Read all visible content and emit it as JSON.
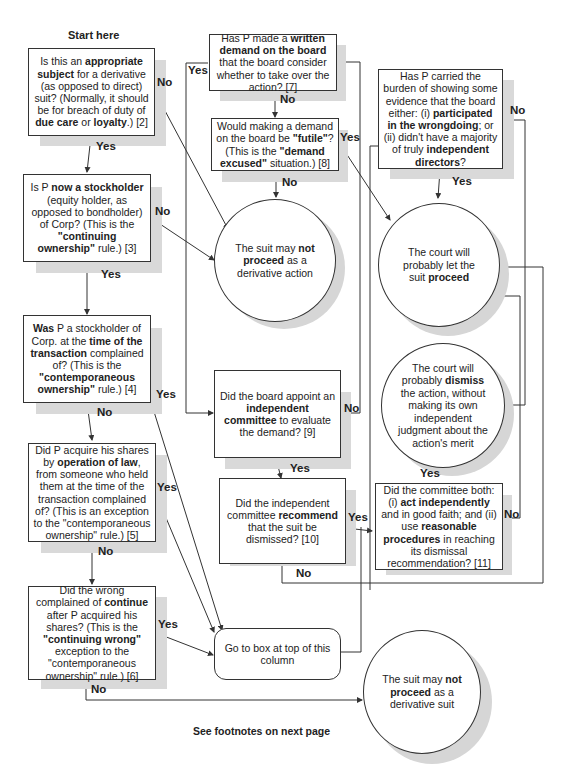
{
  "header": {
    "start_label": "Start here"
  },
  "footer": {
    "note": "See footnotes on next page"
  },
  "nodes": {
    "q2": {
      "parts": [
        "Is this an ",
        "appropriate subject",
        " for a derivative (as opposed to direct) suit? (Normally, it should be for breach of duty of ",
        "due care",
        " or ",
        "loyalty",
        ".) [2]"
      ]
    },
    "q3": {
      "parts": [
        "Is P ",
        "now a stockholder",
        " (equity holder, as opposed to bondholder) of Corp? (This is the ",
        "\"continuing ownership\"",
        " rule.) [3]"
      ]
    },
    "q4": {
      "parts": [
        "Was",
        " P a stockholder of Corp. at the ",
        "time of the transaction",
        " complained of? (This is the ",
        "\"contemporaneous ownership\"",
        " rule.) [4]"
      ]
    },
    "q5": {
      "parts": [
        "Did P acquire his shares by ",
        "operation of law",
        ", from someone who held them at the time of the transaction complained of? (This is an exception to the \"contemporaneous ownership\" rule.) [5]"
      ]
    },
    "q6": {
      "parts": [
        "Did the wrong complained of ",
        "continue",
        " after P acquired his shares? (This is the ",
        "\"continuing wrong\"",
        " exception to the \"contemporaneous ownership\" rule.) [6]"
      ]
    },
    "q7": {
      "parts": [
        "Has P made a ",
        "written demand on the board",
        " that the board consider whether to take over the action? [7]"
      ]
    },
    "q8": {
      "parts": [
        "Would making a demand on the board be ",
        "\"futile\"",
        "? (This is the ",
        "\"demand excused\"",
        " situation.) [8]"
      ]
    },
    "q9": {
      "parts": [
        "Did the board appoint an ",
        "independent committee",
        " to evaluate the demand? [9]"
      ]
    },
    "q10": {
      "parts": [
        "Did the independent committee ",
        "recommend",
        " that the suit be dismissed? [10]"
      ]
    },
    "q11": {
      "parts": [
        "Did the committee both: (i) ",
        "act independently",
        " and in good faith; and (ii) use ",
        "reasonable procedures",
        " in reaching its dismissal recommendation? [11]"
      ]
    },
    "qb": {
      "parts": [
        "Has P carried the burden of showing some evidence that the board either: (i) ",
        "participated in the wrongdoing",
        "; or (ii) didn't have a majority of truly ",
        "independent directors",
        "?"
      ]
    },
    "end_not_action": {
      "parts": [
        "The suit may ",
        "not proceed",
        " as a derivative action"
      ]
    },
    "end_proceed": {
      "parts": [
        "The court will probably let the suit ",
        "proceed",
        ""
      ]
    },
    "end_dismiss": {
      "parts": [
        "The court will probably ",
        "dismiss",
        " the action, without making its own independent judgment about the action's merit"
      ]
    },
    "end_not_suit": {
      "parts": [
        "The suit may ",
        "not proceed",
        " as a derivative suit"
      ]
    },
    "goto": {
      "text": "Go to box at top of this column"
    }
  },
  "edge_labels": {
    "q2_no": "No",
    "q2_yes": "Yes",
    "q3_no": "No",
    "q3_yes": "Yes",
    "q4_yes": "Yes",
    "q4_no": "No",
    "q5_yes": "Yes",
    "q5_no": "No",
    "q6_yes": "Yes",
    "q6_no": "No",
    "q7_yes": "Yes",
    "q7_no": "No",
    "q8_yes": "Yes",
    "q8_no": "No",
    "q9_yes": "Yes",
    "q9_no": "No",
    "q10_yes": "Yes",
    "q10_no": "No",
    "q11_yes": "Yes",
    "q11_no": "No",
    "qb_yes": "Yes",
    "qb_no": "No"
  }
}
